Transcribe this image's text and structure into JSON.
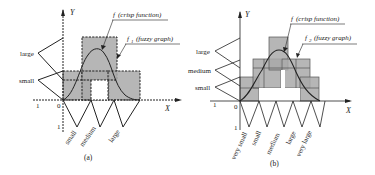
{
  "panel_a": {
    "caption": "(a)",
    "y_axis_label": "Y",
    "x_axis_label": "X",
    "origin_label": "0",
    "x_one_label": "1",
    "y_one_label": "1",
    "y_fuzzy_sets": [
      "large",
      "small"
    ],
    "x_fuzzy_sets": [
      "small",
      "medium",
      "large"
    ],
    "crisp_label_f": "f",
    "crisp_label_text": "(crisp function)",
    "fuzzy_label_f": "f",
    "fuzzy_label_sub": "1",
    "fuzzy_label_text": "(fuzzy graph)",
    "box_style": "dashed"
  },
  "panel_b": {
    "caption": "(b)",
    "y_axis_label": "Y",
    "x_axis_label": "X",
    "origin_label": "0",
    "x_one_label": "1",
    "y_one_label": "1",
    "y_fuzzy_sets": [
      "large",
      "medium",
      "small"
    ],
    "x_fuzzy_sets": [
      "very small",
      "small",
      "medium",
      "large",
      "very large"
    ],
    "crisp_label_f": "f",
    "crisp_label_text": "(crisp function)",
    "fuzzy_label_f": "f",
    "fuzzy_label_sub": "2",
    "fuzzy_label_text": "(fuzzy graph)",
    "box_style": "solid"
  },
  "colors": {
    "shade": "#a9a9a9",
    "line": "#222222",
    "background": "#ffffff"
  }
}
